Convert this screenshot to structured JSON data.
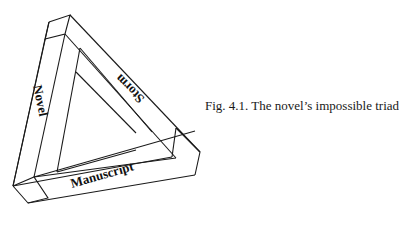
{
  "figure": {
    "caption": "Fig. 4.1. The novel’s impossible triad",
    "labels": {
      "left": "Novel",
      "right": "Storm",
      "bottom": "Manuscript"
    },
    "stroke_color": "#1a1a1a",
    "background": "#ffffff"
  }
}
